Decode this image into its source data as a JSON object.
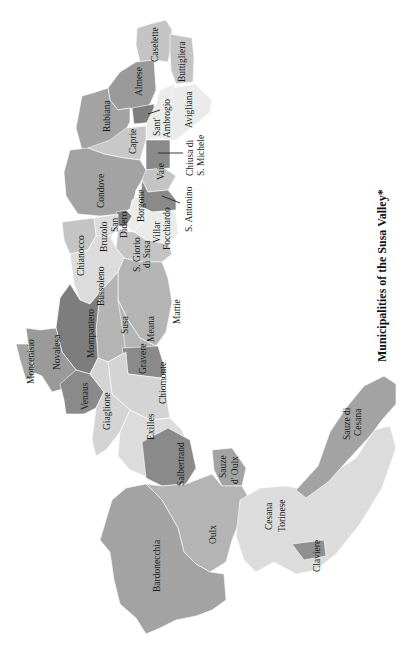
{
  "figure": {
    "title": "Municipalities of the Susa Valley*",
    "orientation": "rotated 90° counter-clockwise (text reads bottom-to-top)"
  },
  "legend_shades": {
    "dark": "#7d7d7d",
    "medium_dark": "#8f8f8f",
    "medium": "#a3a3a3",
    "light": "#c4c4c4",
    "very_light": "#dcdcdc",
    "palest": "#ebebeb"
  },
  "municipalities": [
    {
      "name": "Caselette"
    },
    {
      "name": "Buttigliera"
    },
    {
      "name": "Almese"
    },
    {
      "name": "Rubiana"
    },
    {
      "name": "Sant' Ambrogio",
      "line1": "Sant'",
      "line2": "Ambrogio"
    },
    {
      "name": "Avigliana"
    },
    {
      "name": "Caprie"
    },
    {
      "name": "Chiusa di S. Michele",
      "line1": "Chiusa di",
      "line2": "S. Michele"
    },
    {
      "name": "Vaie"
    },
    {
      "name": "Condove"
    },
    {
      "name": "Borgone"
    },
    {
      "name": "S. Antonino"
    },
    {
      "name": "San Didero",
      "line1": "San",
      "line2": "Didero"
    },
    {
      "name": "Villar Focchiardo",
      "line1": "Villar",
      "line2": "Focchiardo"
    },
    {
      "name": "Bruzolo"
    },
    {
      "name": "S. Giorio di Susa",
      "line1": "S. Giorio",
      "line2": "di Susa"
    },
    {
      "name": "Chianocco"
    },
    {
      "name": "Bussoleno"
    },
    {
      "name": "Mattie"
    },
    {
      "name": "Susa"
    },
    {
      "name": "Meana"
    },
    {
      "name": "Mompantero"
    },
    {
      "name": "Novalesa"
    },
    {
      "name": "Moncenisio"
    },
    {
      "name": "Venaus"
    },
    {
      "name": "Gravere"
    },
    {
      "name": "Chiomonte"
    },
    {
      "name": "Giaglione"
    },
    {
      "name": "Exilles"
    },
    {
      "name": "Salbertrand"
    },
    {
      "name": "Sauze d'Oulx",
      "line1": "Sauze",
      "line2": "d' Oulx"
    },
    {
      "name": "Oulx"
    },
    {
      "name": "Bardonecchia"
    },
    {
      "name": "Cesana Torinese",
      "line1": "Cesana",
      "line2": "Torinese"
    },
    {
      "name": "Claviere"
    },
    {
      "name": "Sauze di Cesana",
      "line1": "Sauze di",
      "line2": "Cesana"
    }
  ]
}
